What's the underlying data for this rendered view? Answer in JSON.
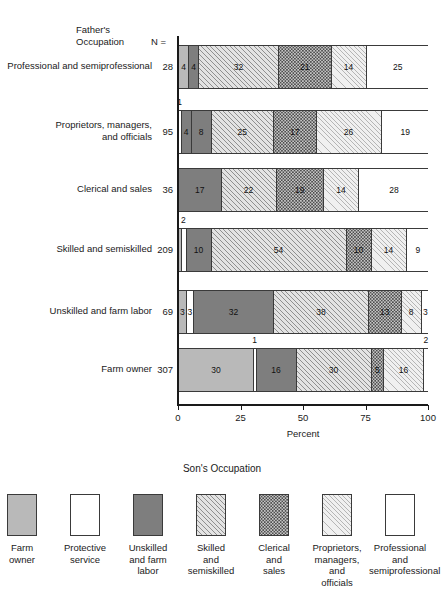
{
  "header": {
    "title_line1": "Father's",
    "title_line2": "Occupation",
    "n_label": "N ="
  },
  "axis": {
    "ticks": [
      "0",
      "25",
      "50",
      "75",
      "100"
    ],
    "title": "Percent"
  },
  "legend": {
    "title": "Son's Occupation",
    "items": [
      {
        "key": "farm",
        "label": "Farm\nowner"
      },
      {
        "key": "prot",
        "label": "Protective\nservice"
      },
      {
        "key": "unsk",
        "label": "Unskilled\nand farm\nlabor"
      },
      {
        "key": "skil",
        "label": "Skilled\nand\nsemiskilled"
      },
      {
        "key": "cler",
        "label": "Clerical\nand\nsales"
      },
      {
        "key": "prop",
        "label": "Proprietors,\nmanagers,\nand\nofficials"
      },
      {
        "key": "prof",
        "label": "Professional\nand\nsemiprofessional"
      }
    ]
  },
  "chart_data": {
    "type": "bar",
    "orientation": "horizontal",
    "stacked": true,
    "title": "",
    "xlabel": "Percent",
    "ylabel": "Father's Occupation",
    "xlim": [
      0,
      100
    ],
    "xticks": [
      0,
      25,
      50,
      75,
      100
    ],
    "grid": false,
    "legend_position": "bottom",
    "legend_title": "Son's Occupation",
    "categories": [
      "Professional and semiprofessional",
      "Proprietors, managers, and officials",
      "Clerical and sales",
      "Skilled and semiskilled",
      "Unskilled and farm labor",
      "Farm owner"
    ],
    "counts": [
      28,
      95,
      36,
      209,
      69,
      307
    ],
    "series": [
      {
        "name": "Farm owner",
        "key": "farm",
        "values": [
          4,
          0,
          0,
          1,
          3,
          30
        ]
      },
      {
        "name": "Protective service",
        "key": "prot",
        "values": [
          0,
          1,
          0,
          2,
          3,
          1
        ]
      },
      {
        "name": "Unskilled and farm labor",
        "key": "unsk",
        "values": [
          4,
          8,
          17,
          10,
          32,
          16
        ]
      },
      {
        "name": "Skilled and semiskilled",
        "key": "skil",
        "values": [
          32,
          25,
          22,
          54,
          38,
          30
        ]
      },
      {
        "name": "Clerical and sales",
        "key": "cler",
        "values": [
          21,
          17,
          19,
          10,
          13,
          5
        ]
      },
      {
        "name": "Proprietors, managers, and officials",
        "key": "prop",
        "values": [
          14,
          26,
          14,
          14,
          8,
          16
        ]
      },
      {
        "name": "Professional and semiprofessional",
        "key": "prof",
        "values": [
          25,
          19,
          28,
          9,
          3,
          2
        ]
      }
    ]
  },
  "rows": [
    {
      "label": "Professional and semiprofessional",
      "n": "28",
      "segments": [
        {
          "key": "farm",
          "value": 4,
          "text": "4",
          "inside": true
        },
        {
          "key": "unsk",
          "value": 4,
          "text": "4",
          "inside": true
        },
        {
          "key": "skil",
          "value": 32,
          "text": "32",
          "inside": true
        },
        {
          "key": "cler",
          "value": 21,
          "text": "21",
          "inside": true
        },
        {
          "key": "prop",
          "value": 14,
          "text": "14",
          "inside": true
        },
        {
          "key": "prof",
          "value": 25,
          "text": "25",
          "inside": true
        }
      ],
      "callouts": []
    },
    {
      "label": "Proprietors, managers,\nand officials",
      "n": "95",
      "segments": [
        {
          "key": "prot",
          "value": 1,
          "text": "1",
          "inside": false
        },
        {
          "key": "unsk",
          "value": 4,
          "text": "4",
          "inside": true
        },
        {
          "key": "unsk",
          "value": 8,
          "text": "8",
          "inside": true
        },
        {
          "key": "skil",
          "value": 25,
          "text": "25",
          "inside": true
        },
        {
          "key": "cler",
          "value": 17,
          "text": "17",
          "inside": true
        },
        {
          "key": "prop",
          "value": 26,
          "text": "26",
          "inside": true
        },
        {
          "key": "prof",
          "value": 19,
          "text": "19",
          "inside": true
        }
      ],
      "callouts": [
        {
          "text": "1",
          "pct": 0.5
        }
      ]
    },
    {
      "label": "Clerical and sales",
      "n": "36",
      "segments": [
        {
          "key": "unsk",
          "value": 17,
          "text": "17",
          "inside": true
        },
        {
          "key": "skil",
          "value": 22,
          "text": "22",
          "inside": true
        },
        {
          "key": "cler",
          "value": 19,
          "text": "19",
          "inside": true
        },
        {
          "key": "prop",
          "value": 14,
          "text": "14",
          "inside": true
        },
        {
          "key": "prof",
          "value": 28,
          "text": "28",
          "inside": true
        }
      ],
      "callouts": []
    },
    {
      "label": "Skilled and semiskilled",
      "n": "209",
      "segments": [
        {
          "key": "farm",
          "value": 1,
          "text": "1",
          "inside": false
        },
        {
          "key": "prot",
          "value": 2,
          "text": "2",
          "inside": false
        },
        {
          "key": "unsk",
          "value": 10,
          "text": "10",
          "inside": true
        },
        {
          "key": "skil",
          "value": 54,
          "text": "54",
          "inside": true
        },
        {
          "key": "cler",
          "value": 10,
          "text": "10",
          "inside": true
        },
        {
          "key": "prop",
          "value": 14,
          "text": "14",
          "inside": true
        },
        {
          "key": "prof",
          "value": 9,
          "text": "9",
          "inside": true
        }
      ],
      "callouts": [
        {
          "text": "2",
          "pct": 2.0
        }
      ]
    },
    {
      "label": "Unskilled and farm labor",
      "n": "69",
      "segments": [
        {
          "key": "farm",
          "value": 3,
          "text": "3",
          "inside": true
        },
        {
          "key": "prot",
          "value": 3,
          "text": "3",
          "inside": true
        },
        {
          "key": "unsk",
          "value": 32,
          "text": "32",
          "inside": true
        },
        {
          "key": "skil",
          "value": 38,
          "text": "38",
          "inside": true
        },
        {
          "key": "cler",
          "value": 13,
          "text": "13",
          "inside": true
        },
        {
          "key": "prop",
          "value": 8,
          "text": "8",
          "inside": true
        },
        {
          "key": "prof",
          "value": 3,
          "text": "3",
          "inside": true
        }
      ],
      "callouts": []
    },
    {
      "label": "Farm owner",
      "n": "307",
      "segments": [
        {
          "key": "farm",
          "value": 30,
          "text": "30",
          "inside": true
        },
        {
          "key": "prot",
          "value": 1,
          "text": "1",
          "inside": false
        },
        {
          "key": "unsk",
          "value": 16,
          "text": "16",
          "inside": true
        },
        {
          "key": "skil",
          "value": 30,
          "text": "30",
          "inside": true
        },
        {
          "key": "cler",
          "value": 5,
          "text": "5",
          "inside": true
        },
        {
          "key": "prop",
          "value": 16,
          "text": "16",
          "inside": true
        },
        {
          "key": "prof",
          "value": 2,
          "text": "2",
          "inside": false
        }
      ],
      "callouts": [
        {
          "text": "1",
          "pct": 30.5
        },
        {
          "text": "2",
          "pct": 99.0
        }
      ]
    }
  ]
}
